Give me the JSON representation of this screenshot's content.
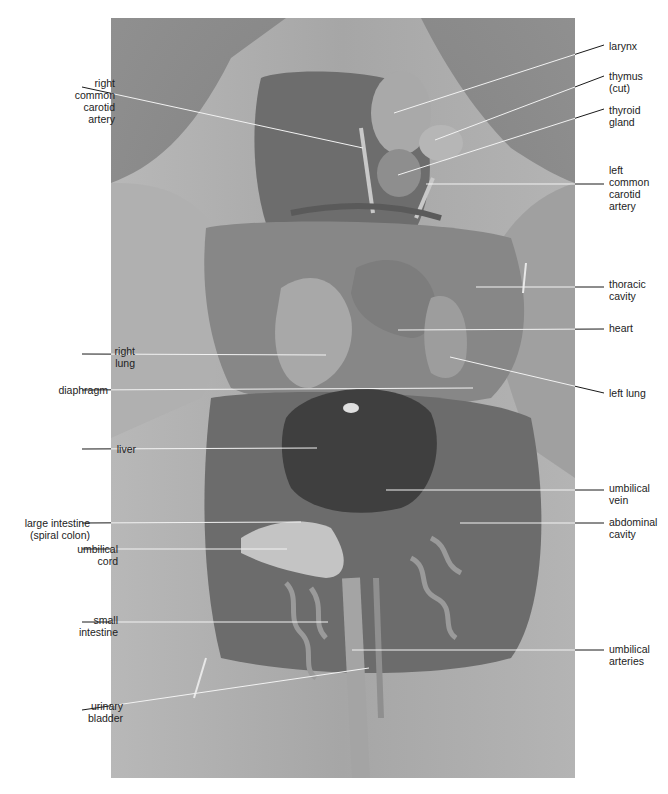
{
  "figure": {
    "colors": {
      "background": "#ffffff",
      "photo_base": "#8a8a8a",
      "label_text": "#222222",
      "leader_line_dark": "#1a1a1a",
      "leader_line_light": "#f2f2f2"
    }
  },
  "labels_left": [
    {
      "id": "right-common-carotid-artery",
      "text": "right\ncommon\ncarotid\nartery",
      "x": 37,
      "y": 77,
      "line_y": 87,
      "target": [
        363,
        148
      ]
    },
    {
      "id": "right-lung",
      "text": "right\nlung",
      "x": 57,
      "y": 345,
      "line_y": 354,
      "target": [
        326,
        355
      ]
    },
    {
      "id": "diaphragm",
      "text": "diaphragm",
      "x": 30,
      "y": 384,
      "line_y": 390,
      "target": [
        473,
        388
      ]
    },
    {
      "id": "liver",
      "text": "liver",
      "x": 58,
      "y": 443,
      "line_y": 449,
      "target": [
        317,
        448
      ]
    },
    {
      "id": "large-intestine",
      "text": "large intestine\n(spiral colon)",
      "x": 12,
      "y": 517,
      "line_y": 523,
      "target": [
        301,
        522
      ]
    },
    {
      "id": "umbilical-cord",
      "text": "umbilical\ncord",
      "x": 40,
      "y": 543,
      "line_y": 549,
      "target": [
        287,
        549
      ]
    },
    {
      "id": "small-intestine",
      "text": "small\nintestine",
      "x": 40,
      "y": 614,
      "line_y": 622,
      "target": [
        328,
        622
      ]
    },
    {
      "id": "urinary-bladder",
      "text": "urinary\nbladder",
      "x": 45,
      "y": 700,
      "line_y": 710,
      "target": [
        369,
        668
      ]
    }
  ],
  "labels_right": [
    {
      "id": "larynx",
      "text": "larynx",
      "x": 609,
      "y": 40,
      "line_y": 45,
      "target": [
        394,
        113
      ]
    },
    {
      "id": "thymus",
      "text": "thymus\n(cut)",
      "x": 609,
      "y": 70,
      "line_y": 76,
      "target": [
        435,
        140
      ]
    },
    {
      "id": "thyroid-gland",
      "text": "thyroid\ngland",
      "x": 609,
      "y": 104,
      "line_y": 109,
      "target": [
        398,
        175
      ]
    },
    {
      "id": "left-common-carotid-artery",
      "text": "left\ncommon\ncarotid\nartery",
      "x": 609,
      "y": 164,
      "line_y": 184,
      "target": [
        426,
        184
      ]
    },
    {
      "id": "thoracic-cavity",
      "text": "thoracic\ncavity",
      "x": 609,
      "y": 278,
      "line_y": 287,
      "target": [
        476,
        287
      ]
    },
    {
      "id": "heart",
      "text": "heart",
      "x": 609,
      "y": 322,
      "line_y": 329,
      "target": [
        398,
        330
      ]
    },
    {
      "id": "left-lung",
      "text": "left lung",
      "x": 609,
      "y": 387,
      "line_y": 393,
      "target": [
        450,
        357
      ]
    },
    {
      "id": "umbilical-vein",
      "text": "umbilical\nvein",
      "x": 609,
      "y": 482,
      "line_y": 490,
      "target": [
        386,
        490
      ]
    },
    {
      "id": "abdominal-cavity",
      "text": "abdominal\ncavity",
      "x": 609,
      "y": 516,
      "line_y": 523,
      "target": [
        460,
        523
      ]
    },
    {
      "id": "umbilical-arteries",
      "text": "umbilical\narteries",
      "x": 609,
      "y": 643,
      "line_y": 650,
      "target": [
        352,
        650
      ]
    }
  ]
}
